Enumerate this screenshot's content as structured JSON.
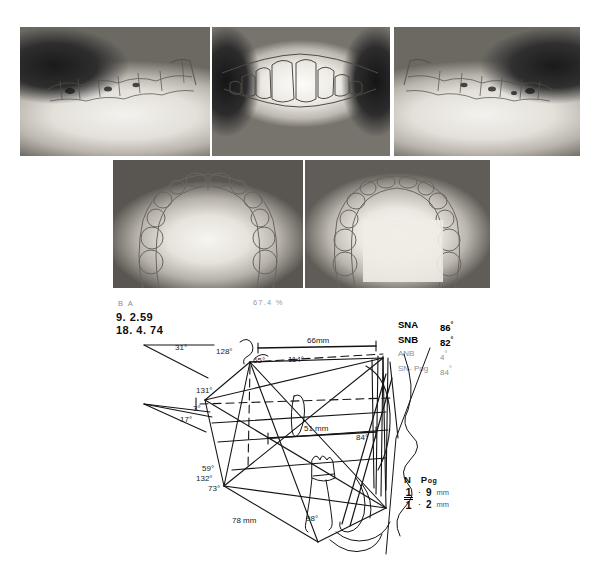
{
  "page": {
    "background": "#ffffff"
  },
  "photos": {
    "row1": [
      {
        "name": "left-lateral-occlusion",
        "caption": ""
      },
      {
        "name": "frontal-occlusion",
        "caption": ""
      },
      {
        "name": "right-lateral-occlusion",
        "caption": ""
      }
    ],
    "row2": [
      {
        "name": "maxillary-occlusal-view",
        "caption": ""
      },
      {
        "name": "mandibular-occlusal-view",
        "caption": ""
      }
    ]
  },
  "labels": {
    "ba": "B A",
    "percent": "67.4 %",
    "date_before": "9. 2.59",
    "date_after": "18. 4. 74"
  },
  "cephalometric_values": {
    "rows": [
      {
        "key": "SNA",
        "value": "86",
        "unit": "°",
        "emphasis": "strong"
      },
      {
        "key": "SNB",
        "value": "82",
        "unit": "°",
        "emphasis": "strong"
      },
      {
        "key": "ANB",
        "value": "4",
        "unit": "°",
        "emphasis": "faint"
      },
      {
        "key": "SN- Pog",
        "value": "84",
        "unit": "°",
        "emphasis": "faint"
      }
    ]
  },
  "incisor_values": {
    "header_n": "N",
    "header_pog_main": "P",
    "header_pog_sub": "og",
    "rows": [
      {
        "tooth": "1",
        "bar": "over",
        "dot": "·",
        "value": "9",
        "unit": "mm"
      },
      {
        "tooth": "1",
        "bar": "under",
        "dot": "·",
        "value": "2",
        "unit": "mm"
      }
    ]
  },
  "tracing": {
    "name": "cephalometric-tracing",
    "stroke": "#141414",
    "annotations": [
      {
        "id": "ann-31",
        "text": "31°",
        "x": 175,
        "y": 32,
        "size": 8
      },
      {
        "id": "ann-3",
        "text": "3°",
        "x": 193,
        "y": 93,
        "size": 8
      },
      {
        "id": "ann-17",
        "text": "17°",
        "x": 180,
        "y": 104,
        "size": 8
      },
      {
        "id": "ann-128",
        "text": "128°",
        "x": 216,
        "y": 36,
        "size": 8
      },
      {
        "id": "ann-65",
        "text": "65°",
        "x": 253,
        "y": 45,
        "size": 8
      },
      {
        "id": "ann-114",
        "text": "114°",
        "x": 288,
        "y": 44,
        "size": 8
      },
      {
        "id": "ann-66mm",
        "text": "66mm",
        "x": 307,
        "y": 25,
        "size": 8
      },
      {
        "id": "ann-131",
        "text": "131°",
        "x": 202,
        "y": 75,
        "size": 8
      },
      {
        "id": "ann-51mm",
        "text": "51 mm",
        "x": 304,
        "y": 113,
        "size": 8
      },
      {
        "id": "ann-84",
        "text": "84°",
        "x": 356,
        "y": 122,
        "size": 8
      },
      {
        "id": "ann-59",
        "text": "59°",
        "x": 205,
        "y": 153,
        "size": 8
      },
      {
        "id": "ann-132",
        "text": "132°",
        "x": 200,
        "y": 163,
        "size": 8
      },
      {
        "id": "ann-73",
        "text": "73°",
        "x": 210,
        "y": 172,
        "size": 8
      },
      {
        "id": "ann-78mm",
        "text": "78 mm",
        "x": 235,
        "y": 204,
        "size": 8
      },
      {
        "id": "ann-98",
        "text": "98°",
        "x": 306,
        "y": 203,
        "size": 8
      }
    ]
  }
}
